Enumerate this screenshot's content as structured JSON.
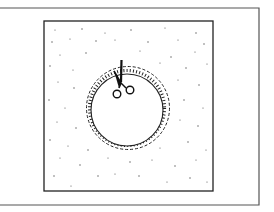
{
  "figure": {
    "colors": {
      "ink": "#2a2a2a",
      "background": "#ffffff",
      "speckle": "#555555"
    },
    "elements": [
      "outer-frame",
      "fabric-square",
      "speckle-texture",
      "cut-circle",
      "dashed-seam-line",
      "notched-edge",
      "scissors-icon"
    ]
  }
}
